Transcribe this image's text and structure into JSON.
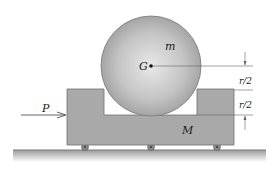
{
  "diagram": {
    "labels": {
      "disk_mass": "m",
      "center": "G",
      "cart_mass": "M",
      "force": "P",
      "dim_upper": "r/2",
      "dim_lower": "r/2"
    },
    "colors": {
      "cart": "#a8a8a8",
      "cart_edge": "#6e6e6e",
      "disk_light": "#eaeaea",
      "disk_dark": "#9a9a9a",
      "ground": "#8a8a8a",
      "line": "#555555"
    }
  }
}
